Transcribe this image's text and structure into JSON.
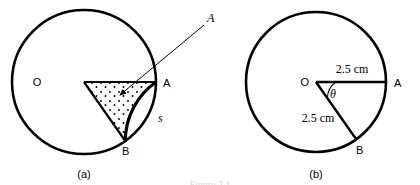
{
  "figure": {
    "caption_a": "(a)",
    "caption_b": "(b)",
    "footer_partial": "Figure 2.1"
  },
  "diagram_a": {
    "center_label": "O",
    "point_a_label": "A",
    "point_b_label": "B",
    "arc_label": "s",
    "callout_label": "A",
    "geometry": {
      "circle_center_x": 84,
      "circle_center_y": 82,
      "circle_radius": 72,
      "radius_oa_angle_deg": 0,
      "radius_ob_angle_deg": -55,
      "sector_shaded": "stippled-dots",
      "callout_from_x": 205,
      "callout_from_y": 24,
      "callout_to_x": 118,
      "callout_to_y": 96
    }
  },
  "diagram_b": {
    "center_label": "O",
    "point_a_label": "A",
    "point_b_label": "B",
    "angle_label": "θ",
    "radius_oa_label": "2.5 cm",
    "radius_ob_label": "2.5 cm",
    "geometry": {
      "circle_center_x": 316,
      "circle_center_y": 82,
      "circle_radius": 70,
      "radius_oa_angle_deg": 0,
      "radius_ob_angle_deg": -55
    }
  },
  "style": {
    "stroke_color": "#000000",
    "background_color": "#ffffff",
    "circle_stroke_width": 2.6,
    "radius_stroke_width": 2.2
  }
}
